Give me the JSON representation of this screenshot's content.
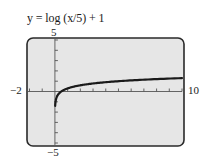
{
  "chart_data": {
    "type": "line",
    "title": "y = log (x/5) + 1",
    "xlabel": "",
    "ylabel": "",
    "xlim": [
      -2,
      10
    ],
    "ylim": [
      -5,
      5
    ],
    "x_tick_step": 1,
    "y_tick_step": 1,
    "grid": false,
    "legend": null,
    "tick_labels": {
      "x_min": "−2",
      "x_max": "10",
      "y_min": "−5",
      "y_max": "5"
    },
    "series": [
      {
        "name": "y = log(x/5) + 1",
        "function": "log10(x/5) + 1",
        "x": [
          0.02,
          0.05,
          0.1,
          0.2,
          0.5,
          1,
          2,
          3,
          4,
          5,
          6,
          7,
          8,
          9,
          10
        ],
        "y": [
          -1.4,
          -1.0,
          -0.7,
          -0.4,
          0.0,
          0.3,
          0.6,
          0.78,
          0.9,
          1.0,
          1.08,
          1.15,
          1.2,
          1.26,
          1.3
        ]
      }
    ]
  },
  "style": {
    "frame_fill": "#e6e6e6",
    "frame_stroke": "#2a2a2a",
    "axis_color": "#555555",
    "curve_color": "#1a1a1a"
  }
}
